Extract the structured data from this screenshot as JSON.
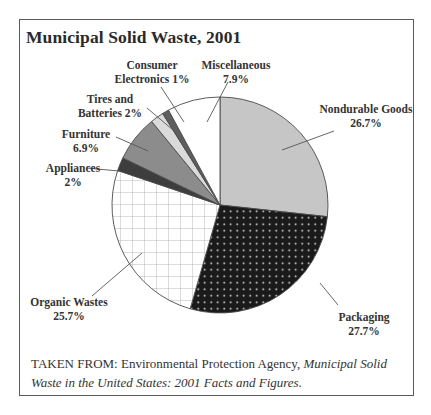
{
  "chart_data": {
    "type": "pie",
    "title": "Municipal Solid Waste, 2001",
    "start_angle": "12 o'clock, clockwise",
    "slices": [
      {
        "label": "Nondurable Goods",
        "value": 26.7,
        "display": "26.7%",
        "fill": "#c6c6c6",
        "pattern": "solid"
      },
      {
        "label": "Packaging",
        "value": 27.7,
        "display": "27.7%",
        "fill": "#1a1a1a",
        "pattern": "white-dots"
      },
      {
        "label": "Organic Wastes",
        "value": 25.7,
        "display": "25.7%",
        "fill": "#ffffff",
        "pattern": "grid"
      },
      {
        "label": "Appliances",
        "value": 2.0,
        "display": "2%",
        "fill": "#3d3d3d",
        "pattern": "solid"
      },
      {
        "label": "Furniture",
        "value": 6.9,
        "display": "6.9%",
        "fill": "#8c8c8c",
        "pattern": "solid"
      },
      {
        "label": "Tires and Batteries",
        "value": 2.0,
        "display": "2%",
        "fill": "#dadada",
        "pattern": "solid"
      },
      {
        "label": "Consumer Electronics",
        "value": 1.0,
        "display": "1%",
        "fill": "#5e5e5e",
        "pattern": "solid"
      },
      {
        "label": "Miscellaneous",
        "value": 7.9,
        "display": "7.9%",
        "fill": "#ffffff",
        "pattern": "solid"
      }
    ],
    "source": "TAKEN FROM: Environmental Protection Agency, Municipal Solid Waste in the United States: 2001 Facts and Figures."
  },
  "labels": {
    "nondurable": [
      "Nondurable Goods",
      "26.7%"
    ],
    "packaging": [
      "Packaging",
      "27.7%"
    ],
    "organic": [
      "Organic Wastes",
      "25.7%"
    ],
    "appliances": [
      "Appliances",
      "2%"
    ],
    "furniture": [
      "Furniture",
      "6.9%"
    ],
    "tires": [
      "Tires and",
      "Batteries 2%"
    ],
    "electronics": [
      "Consumer",
      "Electronics 1%"
    ],
    "misc": [
      "Miscellaneous",
      "7.9%"
    ]
  },
  "source": {
    "prefix": "TAKEN FROM: Environmental Protection Agency, ",
    "italic": "Municipal Solid Waste in the United States: 2001 Facts and Figures."
  }
}
